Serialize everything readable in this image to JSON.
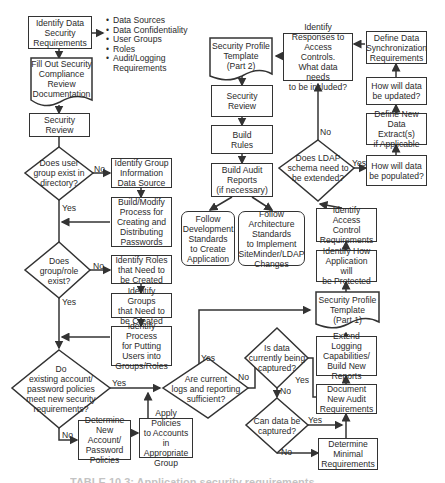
{
  "diagram": {
    "type": "flowchart",
    "nodes": {
      "identify_data_security": "Identify Data\nSecurity\nRequirements",
      "fill_out_compliance": "Fill Out Security\nCompliance\nReview\nDocumentation",
      "security_review_1": "Security\nReview",
      "q_user_group_exists": "Does user\ngroup exist in\ndirectory?",
      "identify_group_info_source": "Identify Group\nInformation\nData Source",
      "build_modify_process": "Build/Modify\nProcess for\nCreating and\nDistributing\nPasswords",
      "q_group_role_exists": "Does\ngroup/role\nexist?",
      "identify_roles": "Identify Roles\nthat Need to\nbe Created",
      "identify_groups": "Identify Groups\nthat Need to\nbe Created",
      "identify_process_putting_users": "Identify Process\nfor Putting\nUsers into\nGroups/Roles",
      "q_existing_policies": "Do\nexisting account/\npassword policies\nmeet new security\nrequirements?",
      "determine_new_policies": "Determine\nNew Account/\nPassword\nPolicies",
      "apply_policies": "Apply Policies\nto Accounts in\nAppropriate\nGroup",
      "q_logs_sufficient": "Are current\nlogs and reporting\nsufficient?",
      "q_data_captured": "Is data\ncurrently being\ncaptured?",
      "q_can_capture": "Can data be\ncaptured?",
      "determine_minimal": "Determine\nMinimal\nRequirements",
      "document_audit": "Document\nNew Audit\nRequirements",
      "extend_logging": "Extend Logging\nCapabilities/\nBuild New\nReports",
      "security_profile_part1": "Security Profile\nTemplate\n(Part 1)",
      "identify_how_protected": "Identify How\nApplication will\nbe Protected",
      "identify_access_control": "Identify Access\nControl\nRequirements",
      "q_ldap_extend": "Does LDAP\nschema need to\nbe extended?",
      "how_populated": "How will data\nbe populated?",
      "define_new_extracts": "Define New\nData Extract(s)\nif Applicable",
      "how_updated": "How will data\nbe updated?",
      "define_sync": "Define Data\nSynchronization\nRequirements",
      "identify_responses": "Identify\nResponses to\nAccess Controls.\nWhat data needs\nto be included?",
      "security_profile_part2": "Security Profile\nTemplate\n(Part 2)",
      "security_review_2": "Security\nReview",
      "build_rules": "Build\nRules",
      "build_audit_reports": "Build Audit\nReports\n(if necessary)",
      "follow_dev_standards": "Follow\nDevelopment\nStandards\nto Create\nApplication",
      "follow_arch_standards": "Follow\nArchitecture\nStandards\nto Implement\nSiteMinder/LDAP\nChanges"
    },
    "requirement_bullets": [
      "Data Sources",
      "Data Confidentiality",
      "User Groups",
      "Roles",
      "Audit/Logging\nRequirements"
    ],
    "edge_labels": {
      "yes": "Yes",
      "no": "No"
    },
    "caption": "TABLE 10.3: Application security requirements"
  }
}
